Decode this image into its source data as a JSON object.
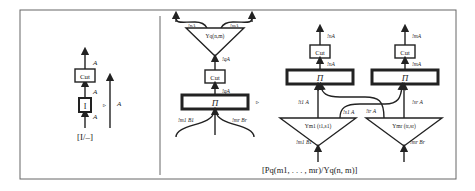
{
  "left_panel": {
    "cut_label": "Cut",
    "identity_label": "I",
    "wire_top": "A",
    "wire_mid": "A",
    "wire_bot": "A",
    "rewrite_arrow": "▹",
    "result_wire": "A",
    "caption": "[I/–]"
  },
  "right_panel": {
    "lhs": {
      "upsilon_label": "Υq(n,m)",
      "top_left_wire": "!nA",
      "top_right_wire": "!mA",
      "below_upsilon_wire": "!qA",
      "cut_label": "Cut",
      "above_pi_wire": "!qA",
      "pi_label": "Π",
      "in_left_wire": "!m1 B1",
      "in_right_wire": "!mr Br"
    },
    "rewrite_arrow": "▹",
    "rhs": {
      "left": {
        "top_wire": "!nA",
        "cut_label": "Cut",
        "above_pi_wire": "!nA",
        "pi_label": "Π",
        "side_wire": "!t1 A",
        "cross_wire": "!s1 A",
        "upsilon_label": "Υm1 (t1,s1)",
        "in_wire": "!m1 B1"
      },
      "right": {
        "top_wire": "!mA",
        "cut_label": "Cut",
        "above_pi_wire": "!mA",
        "pi_label": "Π",
        "side_wire": "!sr A",
        "cross_wire": "!tr A",
        "upsilon_label": "Υmr (tr,sr)",
        "in_wire": "!mr Br"
      }
    },
    "caption": "[Pq(m1, . . . , mr)/Υq(n, m)]"
  },
  "colors": {
    "stroke": "#222222",
    "frame": "#555555"
  }
}
